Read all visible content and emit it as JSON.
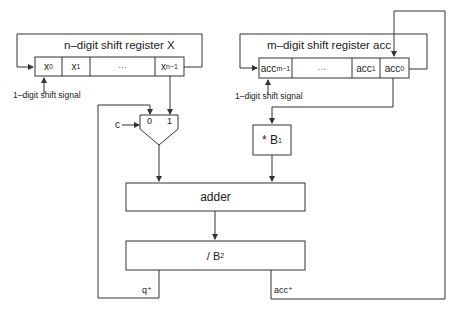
{
  "register_x": {
    "title": "n–digit shift register X",
    "cells": [
      {
        "base": "x",
        "sub": "0"
      },
      {
        "base": "x",
        "sub": "1"
      },
      {
        "base": "...",
        "sub": ""
      },
      {
        "base": "x",
        "sub": "n−1"
      }
    ],
    "shift_signal": "1–digit shift signal"
  },
  "register_acc": {
    "title": "m–digit shift register acc",
    "cells": [
      {
        "base": "acc",
        "sub": "m−1"
      },
      {
        "base": "...",
        "sub": ""
      },
      {
        "base": "acc",
        "sub": "1"
      },
      {
        "base": "acc",
        "sub": "0"
      }
    ],
    "shift_signal": "1–digit shift signal"
  },
  "mux": {
    "select_label": "c",
    "input_0": "0",
    "input_1": "1"
  },
  "multiplier": {
    "op": "* B",
    "sub": "1"
  },
  "adder": {
    "label": "adder"
  },
  "divider": {
    "op": "/ B",
    "sub": "2"
  },
  "outputs": {
    "q_plus": "q⁺",
    "acc_plus": "acc⁺"
  },
  "colors": {
    "line": "#333333",
    "background": "#ffffff"
  }
}
